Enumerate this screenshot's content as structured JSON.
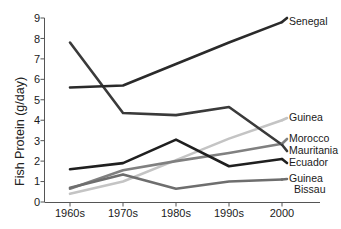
{
  "chart_data": {
    "type": "line",
    "title": "",
    "xlabel": "",
    "ylabel": "Fish Protein (g/day)",
    "categories": [
      "1960s",
      "1970s",
      "1980s",
      "1990s",
      "2000"
    ],
    "ylim": [
      0,
      9
    ],
    "yticks": [
      "0",
      "1",
      "2",
      "3",
      "4",
      "5",
      "6",
      "7",
      "8",
      "9"
    ],
    "grid": false,
    "legend_position": "right-inline-labels",
    "series": [
      {
        "name": "Senegal",
        "values": [
          5.6,
          5.7,
          6.75,
          7.8,
          8.8
        ],
        "color": "#2a2a2a",
        "width": 2.6
      },
      {
        "name": "Mauritania",
        "values": [
          7.8,
          4.35,
          4.25,
          4.65,
          2.8
        ],
        "color": "#3a3a3a",
        "width": 2.6
      },
      {
        "name": "Ecuador",
        "values": [
          1.6,
          1.9,
          3.05,
          1.75,
          2.1
        ],
        "color": "#1f1f1f",
        "width": 2.6
      },
      {
        "name": "Morocco",
        "values": [
          0.65,
          1.55,
          2.0,
          2.4,
          2.85
        ],
        "color": "#808080",
        "width": 2.6
      },
      {
        "name": "Guinea",
        "values": [
          0.4,
          1.0,
          2.05,
          3.1,
          4.0
        ],
        "color": "#c4c4c4",
        "width": 2.6
      },
      {
        "name": "Guinea Bissau",
        "values": [
          0.7,
          1.35,
          0.65,
          1.0,
          1.1
        ],
        "color": "#6e6e6e",
        "width": 2.6
      }
    ],
    "annotations": [
      {
        "text": "Senegal",
        "y_value": 8.8
      },
      {
        "text": "Guinea",
        "y_value": 4.0
      },
      {
        "text": "Morocco",
        "y_value": 3.05
      },
      {
        "text": "Mauritania",
        "y_value": 2.55
      },
      {
        "text": "Ecuador",
        "y_value": 1.95
      },
      {
        "text": "Guinea",
        "y_value": 1.15
      },
      {
        "text": "Bissau",
        "y_value": 0.65
      }
    ]
  },
  "axis": {
    "y_title": "Fish Protein (g/day)",
    "y_tick_0": "0",
    "y_tick_1": "1",
    "y_tick_2": "2",
    "y_tick_3": "3",
    "y_tick_4": "4",
    "y_tick_5": "5",
    "y_tick_6": "6",
    "y_tick_7": "7",
    "y_tick_8": "8",
    "y_tick_9": "9",
    "x_tick_0": "1960s",
    "x_tick_1": "1970s",
    "x_tick_2": "1980s",
    "x_tick_3": "1990s",
    "x_tick_4": "2000"
  },
  "labels": {
    "senegal": "Senegal",
    "guinea": "Guinea",
    "morocco": "Morocco",
    "mauritania": "Mauritania",
    "ecuador": "Ecuador",
    "guinea_bissau_line1": "Guinea",
    "guinea_bissau_line2": "Bissau"
  }
}
